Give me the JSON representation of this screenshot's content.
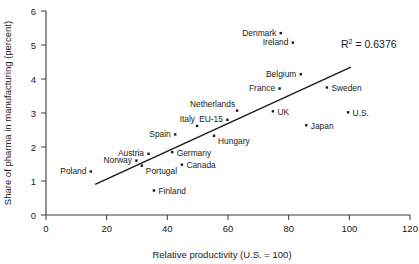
{
  "chart_data": {
    "type": "scatter",
    "title": "",
    "xlabel": "Relative productivity (U.S. = 100)",
    "ylabel": "Share of pharma in manufacturing (percent)",
    "xlim": [
      0,
      120
    ],
    "ylim": [
      0,
      6
    ],
    "xticks": [
      0,
      20,
      40,
      60,
      80,
      100,
      120
    ],
    "yticks": [
      0,
      1,
      2,
      3,
      4,
      5,
      6
    ],
    "grid": false,
    "legend": "none",
    "annotations": [
      {
        "text": "R² = 0.6376",
        "base": "R",
        "sup": "2",
        "rest": " = 0.6376",
        "x": 99,
        "y": 5.0
      }
    ],
    "trendline": {
      "type": "linear-fit",
      "x_start": 16.2,
      "y_start": 0.9,
      "x_end": 100.5,
      "y_end": 4.35,
      "r_squared": 0.6376
    },
    "points": [
      {
        "label": "Poland",
        "x": 14.8,
        "y": 1.28,
        "label_pos": "left"
      },
      {
        "label": "Norway",
        "x": 29.8,
        "y": 1.6,
        "label_pos": "left"
      },
      {
        "label": "Austria",
        "x": 33.8,
        "y": 1.8,
        "label_pos": "left"
      },
      {
        "label": "Portugal",
        "x": 31.6,
        "y": 1.45,
        "label_pos": "right-below"
      },
      {
        "label": "Finland",
        "x": 35.6,
        "y": 0.72,
        "label_pos": "right"
      },
      {
        "label": "Germany",
        "x": 41.6,
        "y": 1.85,
        "label_pos": "right"
      },
      {
        "label": "Canada",
        "x": 44.8,
        "y": 1.48,
        "label_pos": "right"
      },
      {
        "label": "Spain",
        "x": 42.6,
        "y": 2.37,
        "label_pos": "left"
      },
      {
        "label": "Italy",
        "x": 49.8,
        "y": 2.62,
        "label_pos": "left-above"
      },
      {
        "label": "Hungary",
        "x": 55.4,
        "y": 2.33,
        "label_pos": "right-below"
      },
      {
        "label": "EU-15",
        "x": 59.8,
        "y": 2.8,
        "label_pos": "left"
      },
      {
        "label": "Netherlands",
        "x": 63.0,
        "y": 3.07,
        "label_pos": "left-above"
      },
      {
        "label": "UK",
        "x": 74.8,
        "y": 3.05,
        "label_pos": "right"
      },
      {
        "label": "France",
        "x": 77.0,
        "y": 3.72,
        "label_pos": "left"
      },
      {
        "label": "Denmark",
        "x": 77.4,
        "y": 5.35,
        "label_pos": "left"
      },
      {
        "label": "Ireland",
        "x": 81.4,
        "y": 5.07,
        "label_pos": "left"
      },
      {
        "label": "Belgium",
        "x": 84.0,
        "y": 4.14,
        "label_pos": "left"
      },
      {
        "label": "Japan",
        "x": 85.8,
        "y": 2.64,
        "label_pos": "right"
      },
      {
        "label": "Sweden",
        "x": 92.6,
        "y": 3.75,
        "label_pos": "right"
      },
      {
        "label": "U.S.",
        "x": 99.6,
        "y": 3.02,
        "label_pos": "right"
      }
    ]
  }
}
